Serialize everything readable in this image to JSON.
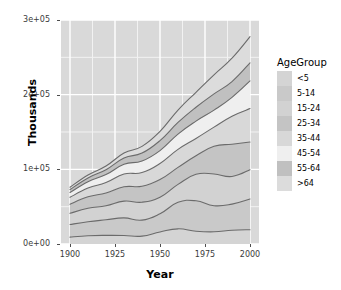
{
  "chart_data": {
    "type": "area",
    "title": "",
    "subtitle": "",
    "xlabel": "Year",
    "ylabel": "Thousands",
    "xlim": [
      1895,
      2005
    ],
    "ylim": [
      0,
      300000
    ],
    "stacked": true,
    "grid": true,
    "legend_position": "right",
    "legend_title": "AgeGroup",
    "x_ticks": [
      1900,
      1925,
      1950,
      1975,
      2000
    ],
    "x_tick_labels": [
      "1900",
      "1925",
      "1950",
      "1975",
      "2000"
    ],
    "y_ticks": [
      0,
      100000,
      200000,
      300000
    ],
    "y_tick_labels": [
      "0e+00",
      "1e+05",
      "2e+05",
      "3e+05"
    ],
    "x": [
      1900,
      1910,
      1920,
      1930,
      1940,
      1950,
      1960,
      1970,
      1980,
      1990,
      2000
    ],
    "series": [
      {
        "name": "<5",
        "color": "#d4d4d4",
        "values": [
          9171,
          11047,
          11573,
          11444,
          10541,
          16163,
          20321,
          17148,
          16348,
          18354,
          19176
        ]
      },
      {
        "name": "5-14",
        "color": "#c9c9c9",
        "values": [
          16962,
          18672,
          20843,
          23490,
          21394,
          24319,
          35465,
          40746,
          34942,
          35095,
          41078
        ]
      },
      {
        "name": "15-24",
        "color": "#d2d2d2",
        "values": [
          14951,
          18121,
          18727,
          22423,
          24033,
          22098,
          24020,
          35441,
          42487,
          37013,
          39184
        ]
      },
      {
        "name": "25-34",
        "color": "#c4c4c4",
        "values": [
          12162,
          15338,
          17170,
          19261,
          21339,
          23759,
          22818,
          24907,
          37082,
          43176,
          37233
        ]
      },
      {
        "name": "35-44",
        "color": "#d8d8d8",
        "values": [
          9245,
          11686,
          14100,
          17119,
          18333,
          21450,
          24081,
          23088,
          25635,
          37579,
          44659
        ]
      },
      {
        "name": "45-54",
        "color": "#efefef",
        "values": [
          6437,
          8597,
          10513,
          13003,
          15512,
          17343,
          20485,
          23220,
          22800,
          25224,
          37031
        ]
      },
      {
        "name": "55-64",
        "color": "#c0c0c0",
        "values": [
          4027,
          5054,
          6532,
          8397,
          10572,
          13370,
          15572,
          18590,
          21703,
          21113,
          24275
        ]
      },
      {
        "name": ">64",
        "color": "#dcdcdc",
        "values": [
          3080,
          3950,
          4933,
          6634,
          9019,
          12270,
          16560,
          20066,
          25550,
          31242,
          34992
        ]
      }
    ],
    "totals": [
      76035,
      92465,
      104391,
      121771,
      130743,
      150772,
      179322,
      203206,
      226547,
      248796,
      277628
    ]
  },
  "axes": {
    "y_title": "Thousands",
    "x_title": "Year"
  },
  "legend": {
    "title": "AgeGroup",
    "items": [
      {
        "label": "<5",
        "color": "#d4d4d4"
      },
      {
        "label": "5-14",
        "color": "#c9c9c9"
      },
      {
        "label": "15-24",
        "color": "#d2d2d2"
      },
      {
        "label": "25-34",
        "color": "#c4c4c4"
      },
      {
        "label": "35-44",
        "color": "#d8d8d8"
      },
      {
        "label": "45-54",
        "color": "#efefef"
      },
      {
        "label": "55-64",
        "color": "#c0c0c0"
      },
      {
        "label": ">64",
        "color": "#dcdcdc"
      }
    ]
  },
  "theme": {
    "panel_background": "#d9d9d9",
    "major_gridline": "#ffffff",
    "minor_gridline": "#f2f2f2",
    "line_color": "#6b6b6b",
    "text_color": "#000000",
    "tick_text_color": "#3a3a3a"
  }
}
